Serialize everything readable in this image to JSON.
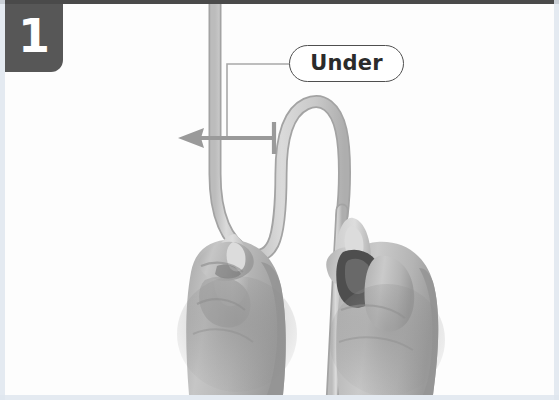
{
  "figure": {
    "kind": "instructional-photo",
    "width": 559,
    "height": 400,
    "background_color": "#ffffff",
    "photo_tone": "grayscale"
  },
  "step_badge": {
    "number": "1",
    "background_color": "#575757",
    "text_color": "#ffffff"
  },
  "annotation": {
    "label": "Under",
    "label_text_color": "#2b2b2b",
    "label_border_color": "#4f4f4f",
    "label_fill_color": "#ffffff",
    "leader_color": "#9a9a9a",
    "arrow": {
      "direction": "left",
      "color": "#9a9a9a",
      "has_end_bar": true
    }
  },
  "cord": {
    "fill_color": "#cfcfcf",
    "outline_color": "#a9a9a9",
    "shape": "bight",
    "strands": [
      "left-vertical-strand",
      "u-bend-loop",
      "right-vertical-strand"
    ]
  },
  "hands": {
    "skin_color": "#b9b9b9",
    "shadow_color": "#8f8f8f",
    "items": [
      {
        "side": "left",
        "grip": "pinch-thumb-index"
      },
      {
        "side": "right",
        "grip": "pinch-thumb-index"
      }
    ]
  },
  "edge_tint_color": "#dfe6ee",
  "top_rule_color": "#4a4a4a"
}
